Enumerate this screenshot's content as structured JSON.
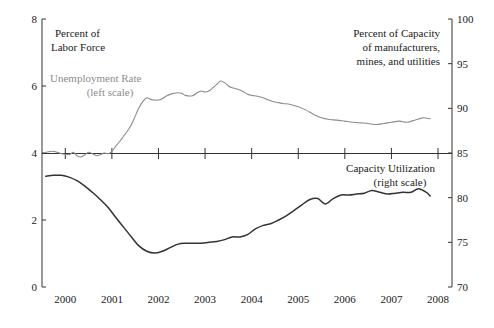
{
  "chart_data": {
    "type": "line",
    "title": "",
    "xlabel": "",
    "grid": false,
    "legend_position": "in-plot annotations",
    "x_axis": {
      "tick_labels": [
        "2000",
        "2001",
        "2002",
        "2003",
        "2004",
        "2005",
        "2006",
        "2007",
        "2008"
      ],
      "xlim": [
        1999.5,
        2008.3
      ]
    },
    "left_axis": {
      "label": "Percent of Labor Force",
      "tick_labels": [
        "8",
        "6",
        "4",
        "2",
        "0"
      ],
      "tick_values": [
        8,
        6,
        4,
        2,
        0
      ],
      "ylim": [
        0,
        8
      ]
    },
    "right_axis": {
      "label": "Percent of Capacity of manufacturers, mines, and utilities",
      "tick_labels": [
        "100",
        "95",
        "90",
        "85",
        "80",
        "75",
        "70"
      ],
      "tick_values": [
        100,
        95,
        90,
        85,
        80,
        75,
        70
      ],
      "ylim": [
        70,
        100
      ]
    },
    "annotations": [
      {
        "id": "left-scale-title-1",
        "text": "Percent of"
      },
      {
        "id": "left-scale-title-2",
        "text": "Labor Force"
      },
      {
        "id": "right-scale-title-1",
        "text": "Percent of Capacity"
      },
      {
        "id": "right-scale-title-2",
        "text": "of manufacturers,"
      },
      {
        "id": "right-scale-title-3",
        "text": "mines, and utilities"
      },
      {
        "id": "unemployment-label-1",
        "text": "Unemployment Rate"
      },
      {
        "id": "unemployment-label-2",
        "text": "(left scale)"
      },
      {
        "id": "capacity-label-1",
        "text": "Capacity Utilization"
      },
      {
        "id": "capacity-label-2",
        "text": "(right scale)"
      }
    ],
    "series": [
      {
        "name": "Unemployment Rate",
        "scale": "left",
        "color": "#8c8c8c",
        "unit": "percent of labor force",
        "x": [
          1999.58,
          1999.75,
          1999.92,
          2000.08,
          2000.17,
          2000.25,
          2000.33,
          2000.42,
          2000.5,
          2000.58,
          2000.67,
          2000.75,
          2000.83,
          2000.92,
          2001.0,
          2001.08,
          2001.17,
          2001.25,
          2001.33,
          2001.42,
          2001.5,
          2001.58,
          2001.67,
          2001.75,
          2001.83,
          2001.92,
          2002.0,
          2002.08,
          2002.17,
          2002.25,
          2002.33,
          2002.42,
          2002.5,
          2002.58,
          2002.67,
          2002.75,
          2002.83,
          2002.92,
          2003.0,
          2003.08,
          2003.17,
          2003.25,
          2003.33,
          2003.42,
          2003.5,
          2003.58,
          2003.67,
          2003.75,
          2003.83,
          2003.92,
          2004.0,
          2004.17,
          2004.33,
          2004.5,
          2004.67,
          2004.83,
          2005.0,
          2005.17,
          2005.33,
          2005.5,
          2005.67,
          2005.83,
          2006.0,
          2006.17,
          2006.33,
          2006.5,
          2006.67,
          2006.83,
          2007.0,
          2007.17,
          2007.33,
          2007.5,
          2007.67,
          2007.83
        ],
        "y": [
          4.02,
          4.05,
          3.98,
          3.95,
          4.02,
          3.92,
          3.88,
          3.95,
          4.02,
          3.98,
          3.92,
          3.95,
          4.0,
          3.98,
          4.05,
          4.2,
          4.35,
          4.5,
          4.65,
          4.85,
          5.1,
          5.35,
          5.55,
          5.65,
          5.6,
          5.58,
          5.58,
          5.62,
          5.7,
          5.75,
          5.78,
          5.8,
          5.78,
          5.72,
          5.7,
          5.72,
          5.8,
          5.85,
          5.82,
          5.85,
          5.95,
          6.05,
          6.15,
          6.1,
          6.0,
          5.95,
          5.92,
          5.88,
          5.82,
          5.75,
          5.72,
          5.68,
          5.6,
          5.52,
          5.48,
          5.45,
          5.38,
          5.28,
          5.15,
          5.05,
          5.0,
          4.98,
          4.95,
          4.92,
          4.9,
          4.88,
          4.85,
          4.88,
          4.92,
          4.95,
          4.92,
          4.98,
          5.05,
          5.02
        ]
      },
      {
        "name": "Capacity Utilization",
        "scale": "right",
        "color": "#333333",
        "unit": "percent of capacity",
        "x": [
          1999.58,
          1999.75,
          1999.92,
          2000.08,
          2000.25,
          2000.42,
          2000.58,
          2000.75,
          2000.92,
          2001.08,
          2001.25,
          2001.42,
          2001.58,
          2001.75,
          2001.92,
          2002.08,
          2002.25,
          2002.42,
          2002.58,
          2002.75,
          2002.92,
          2003.08,
          2003.25,
          2003.42,
          2003.58,
          2003.75,
          2003.92,
          2004.08,
          2004.25,
          2004.42,
          2004.58,
          2004.75,
          2004.92,
          2005.08,
          2005.25,
          2005.42,
          2005.58,
          2005.75,
          2005.92,
          2006.08,
          2006.25,
          2006.42,
          2006.58,
          2006.75,
          2006.92,
          2007.08,
          2007.25,
          2007.42,
          2007.58,
          2007.75,
          2007.83
        ],
        "y": [
          82.4,
          82.5,
          82.5,
          82.3,
          81.9,
          81.3,
          80.6,
          79.8,
          78.9,
          77.8,
          76.7,
          75.6,
          74.6,
          74.0,
          73.8,
          74.0,
          74.4,
          74.8,
          74.9,
          74.9,
          74.9,
          75.0,
          75.1,
          75.3,
          75.6,
          75.6,
          75.9,
          76.5,
          76.9,
          77.1,
          77.5,
          78.0,
          78.6,
          79.2,
          79.8,
          79.9,
          79.3,
          79.9,
          80.3,
          80.3,
          80.4,
          80.5,
          80.8,
          80.6,
          80.4,
          80.5,
          80.6,
          80.6,
          81.0,
          80.6,
          80.2
        ]
      }
    ]
  }
}
